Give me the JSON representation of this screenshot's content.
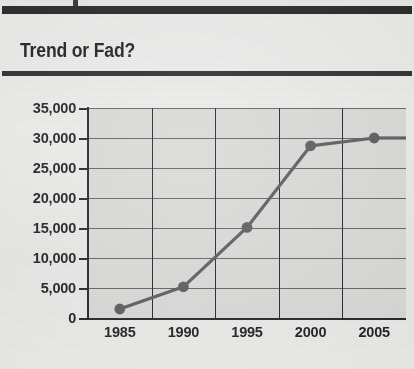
{
  "page": {
    "background_color": "#ebebe9",
    "rule_color": "#1d1d1d"
  },
  "header": {
    "title": "Trend or Fad?"
  },
  "chart_data": {
    "type": "line",
    "title": "Trend or Fad?",
    "xlabel": "",
    "ylabel": "",
    "x": [
      1985,
      1990,
      1995,
      2000,
      2005
    ],
    "xtick_labels": [
      "1985",
      "1990",
      "1995",
      "2000",
      "2005"
    ],
    "values": [
      1500,
      5200,
      15100,
      28700,
      30000
    ],
    "series": [
      {
        "name": "Trend",
        "values": [
          1500,
          5200,
          15100,
          28700,
          30000
        ]
      }
    ],
    "ylim": [
      0,
      35000
    ],
    "ytick_values": [
      0,
      5000,
      10000,
      15000,
      20000,
      25000,
      30000,
      35000
    ],
    "ytick_labels": [
      "0",
      "5,000",
      "10,000",
      "15,000",
      "20,000",
      "25,000",
      "30,000",
      "35,000"
    ],
    "grid": true,
    "legend": false,
    "legend_position": "none",
    "plot_background_color": "#d9d9d7",
    "line_color": "#555555",
    "marker_color": "#555555",
    "marker_shape": "circle",
    "gridline_color": "#5b5b5b",
    "axis_color": "#1b1b1b"
  }
}
